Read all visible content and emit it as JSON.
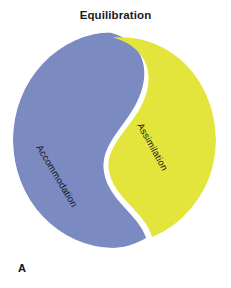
{
  "figure": {
    "title": "Equilibration",
    "panel_letter": "A",
    "background_color": "#ffffff",
    "regions": [
      {
        "id": "accommodation",
        "label": "Accommodation",
        "color": "#7b8ac0",
        "side": "left",
        "label_rotation_deg": 59
      },
      {
        "id": "assimilation",
        "label": "Assimilation",
        "color": "#e3e53c",
        "side": "right",
        "label_rotation_deg": 61
      }
    ],
    "divider": {
      "style": "s-curve",
      "gap_color": "#ffffff",
      "gap_width_px": 5
    },
    "shape": {
      "type": "ellipse",
      "center_x": 114,
      "center_y": 140,
      "radius_x": 101,
      "radius_y": 108
    }
  }
}
